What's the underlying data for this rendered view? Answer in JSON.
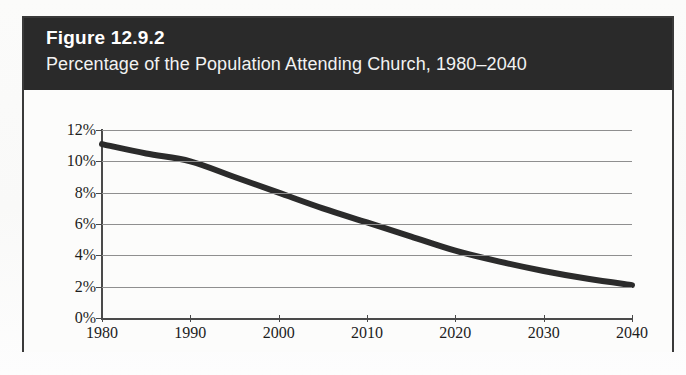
{
  "figure": {
    "number_label": "Figure 12.9.2",
    "subtitle": "Percentage of the Population Attending Church, 1980–2040"
  },
  "colors": {
    "title_band": "#2a2a2a",
    "title_text": "#ffffff",
    "frame_border": "#3a3a3a",
    "plot_background": "#fcfcfb",
    "gridline": "#8f8f8f",
    "axis": "#4a4a4a",
    "series_line": "#2b2b2b",
    "page_background": "#fbfbfa"
  },
  "chart_data": {
    "type": "line",
    "title": "Percentage of the Population Attending Church, 1980–2040",
    "subtitle": "Figure 12.9.2",
    "xlabel": "",
    "ylabel": "",
    "grid": true,
    "legend": false,
    "legend_position": "none",
    "xlim": [
      1980,
      2040
    ],
    "ylim": [
      0,
      12
    ],
    "x_tick_labels": [
      "1980",
      "1990",
      "2000",
      "2010",
      "2020",
      "2030",
      "2040"
    ],
    "x_ticks": [
      1980,
      1990,
      2000,
      2010,
      2020,
      2030,
      2040
    ],
    "y_tick_labels": [
      "12%",
      "10%",
      "8%",
      "6%",
      "4%",
      "2%",
      "0%"
    ],
    "y_ticks": [
      12,
      10,
      8,
      6,
      4,
      2,
      0
    ],
    "series": [
      {
        "name": "Percentage attending church",
        "x": [
          1980,
          1985,
          1990,
          1995,
          2000,
          2005,
          2010,
          2015,
          2020,
          2025,
          2030,
          2035,
          2040
        ],
        "values": [
          11.1,
          10.5,
          10.0,
          9.0,
          8.0,
          7.0,
          6.1,
          5.2,
          4.3,
          3.6,
          3.0,
          2.5,
          2.1
        ]
      }
    ]
  }
}
